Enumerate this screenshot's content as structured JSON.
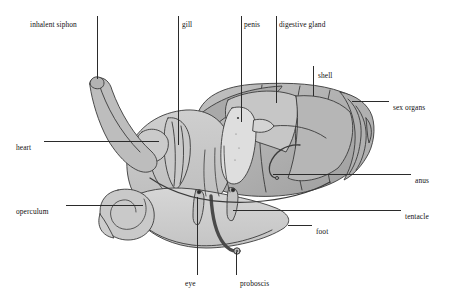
{
  "figure": {
    "background_color": "#ffffff",
    "line_color": "#2b2b2b",
    "palette": {
      "body_light": "#d2d2d2",
      "body_mid": "#bdbdbd",
      "body_dark": "#a3a3a3",
      "shell_mid": "#b8b8b8",
      "shell_dark": "#9a9a9a",
      "outline": "#3a3a3a",
      "text": "#111111"
    }
  },
  "labels": [
    {
      "id": "inhalent-siphon",
      "text": "inhalent siphon",
      "x": 30,
      "y": 21,
      "align": "left"
    },
    {
      "id": "gill",
      "text": "gill",
      "x": 182,
      "y": 21,
      "align": "left"
    },
    {
      "id": "penis",
      "text": "penis",
      "x": 244,
      "y": 21,
      "align": "left"
    },
    {
      "id": "digestive-gland",
      "text": "digestive gland",
      "x": 279,
      "y": 21,
      "align": "left"
    },
    {
      "id": "shell",
      "text": "shell",
      "x": 318,
      "y": 72,
      "align": "left"
    },
    {
      "id": "sex-organs",
      "text": "sex organs",
      "x": 393,
      "y": 104,
      "align": "left"
    },
    {
      "id": "heart",
      "text": "heart",
      "x": 16,
      "y": 144,
      "align": "left"
    },
    {
      "id": "anus",
      "text": "anus",
      "x": 415,
      "y": 177,
      "align": "left"
    },
    {
      "id": "operculum",
      "text": "operculum",
      "x": 16,
      "y": 208,
      "align": "left"
    },
    {
      "id": "tentacle",
      "text": "tentacle",
      "x": 405,
      "y": 213,
      "align": "left"
    },
    {
      "id": "foot",
      "text": "foot",
      "x": 316,
      "y": 228,
      "align": "left"
    },
    {
      "id": "eye",
      "text": "eye",
      "x": 185,
      "y": 280,
      "align": "left"
    },
    {
      "id": "proboscis",
      "text": "proboscis",
      "x": 240,
      "y": 280,
      "align": "left"
    }
  ],
  "leader_lines": [
    {
      "id": "lead-inhalent-siphon",
      "label": "inhalent siphon",
      "points": "97,16 97,79"
    },
    {
      "id": "lead-gill",
      "label": "gill",
      "points": "178,16 178,145"
    },
    {
      "id": "lead-penis",
      "label": "penis",
      "points": "241,16 241,122"
    },
    {
      "id": "lead-digestive-gland",
      "label": "digestive gland",
      "points": "276,16 276,103"
    },
    {
      "id": "lead-shell",
      "label": "shell",
      "points": "313,66 313,96"
    },
    {
      "id": "lead-sex-organs",
      "label": "sex organs",
      "points": "389,101 352,101"
    },
    {
      "id": "lead-heart",
      "label": "heart",
      "points": "44,141 159,141"
    },
    {
      "id": "lead-anus",
      "label": "anus",
      "points": "411,174 273,174"
    },
    {
      "id": "lead-operculum",
      "label": "operculum",
      "points": "66,205 143,205"
    },
    {
      "id": "lead-tentacle",
      "label": "tentacle",
      "points": "401,210 233,210"
    },
    {
      "id": "lead-foot",
      "label": "foot",
      "points": "312,225 288,225"
    },
    {
      "id": "lead-eye",
      "label": "eye",
      "points": "197,275 197,197"
    },
    {
      "id": "lead-proboscis",
      "label": "proboscis",
      "points": "236,275 236,252"
    }
  ],
  "anatomy_parts": [
    {
      "id": "shell",
      "name": "shell"
    },
    {
      "id": "digestive-gland",
      "name": "digestive gland"
    },
    {
      "id": "sex-organs",
      "name": "sex organs"
    },
    {
      "id": "penis",
      "name": "penis"
    },
    {
      "id": "gill",
      "name": "gill"
    },
    {
      "id": "heart",
      "name": "heart"
    },
    {
      "id": "anus",
      "name": "anus"
    },
    {
      "id": "inhalent-siphon",
      "name": "inhalent siphon"
    },
    {
      "id": "operculum",
      "name": "operculum"
    },
    {
      "id": "foot",
      "name": "foot"
    },
    {
      "id": "tentacle",
      "name": "tentacle"
    },
    {
      "id": "eye",
      "name": "eye"
    },
    {
      "id": "proboscis",
      "name": "proboscis"
    }
  ]
}
